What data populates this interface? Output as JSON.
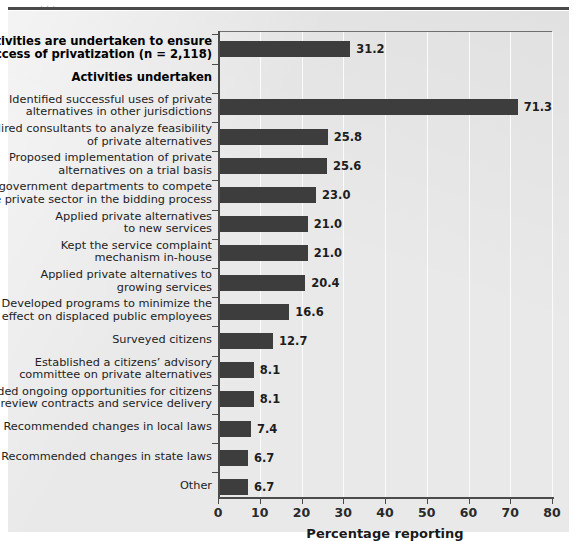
{
  "figure": {
    "caption_remnant": "                                    ,                    ,                 .",
    "background_color": "#e9e9e9",
    "bar_color": "#3d3d3d",
    "axis_color": "#4c4c4c",
    "gridline_color": "#fbfbfb"
  },
  "chart_data": {
    "type": "bar",
    "orientation": "horizontal",
    "title": "",
    "xlabel": "Percentage reporting",
    "ylabel": "",
    "xlim": [
      0,
      80
    ],
    "xticks": [
      0,
      10,
      20,
      30,
      40,
      50,
      60,
      70,
      80
    ],
    "grid": true,
    "legend": null,
    "categories": [
      "Activities are undertaken to ensure\nsuccess of privatization (n = 2,118)",
      "Activities undertaken",
      "Identified successful uses of private\nalternatives in other jurisdictions",
      "Hired consultants to analyze feasibility\nof private alternatives",
      "Proposed implementation of private\nalternatives on a trial basis",
      "Allowed government departments to compete\nwith the private sector in the bidding process",
      "Applied private alternatives\nto new services",
      "Kept the service complaint\nmechanism in-house",
      "Applied private alternatives to\ngrowing services",
      "Developed programs to minimize the\neffect on displaced public employees",
      "Surveyed citizens",
      "Established a citizens' advisory\ncommittee on private alternatives",
      "Provided ongoing opportunities for citizens\nto review contracts and service delivery",
      "Recommended changes in local laws",
      "Recommended changes in state laws",
      "Other"
    ],
    "values": [
      31.2,
      null,
      71.3,
      25.8,
      25.6,
      23.0,
      21.0,
      21.0,
      20.4,
      16.6,
      12.7,
      8.1,
      8.1,
      7.4,
      6.7,
      6.7
    ],
    "value_labels": [
      "31.2",
      "",
      "71.3",
      "25.8",
      "25.6",
      "23.0",
      "21.0",
      "21.0",
      "20.4",
      "16.6",
      "12.7",
      "8.1",
      "8.1",
      "7.4",
      "6.7",
      "6.7"
    ],
    "header_rows": [
      1
    ],
    "bold_rows": [
      0,
      1
    ]
  },
  "rows": [
    {
      "label": "Activities are undertaken to ensure\nsuccess of privatization (n = 2,118)",
      "value": 31.2,
      "value_label": "31.2",
      "bold": true,
      "is_header": false
    },
    {
      "label": "Activities undertaken",
      "value": null,
      "value_label": "",
      "bold": true,
      "is_header": true
    },
    {
      "label": "Identified successful uses of private\nalternatives in other jurisdictions",
      "value": 71.3,
      "value_label": "71.3",
      "bold": false,
      "is_header": false
    },
    {
      "label": "Hired consultants to analyze feasibility\nof private alternatives",
      "value": 25.8,
      "value_label": "25.8",
      "bold": false,
      "is_header": false
    },
    {
      "label": "Proposed implementation of private\nalternatives on a trial basis",
      "value": 25.6,
      "value_label": "25.6",
      "bold": false,
      "is_header": false
    },
    {
      "label": "Allowed government departments to compete\nwith the private sector in the bidding process",
      "value": 23.0,
      "value_label": "23.0",
      "bold": false,
      "is_header": false
    },
    {
      "label": "Applied private alternatives\nto new services",
      "value": 21.0,
      "value_label": "21.0",
      "bold": false,
      "is_header": false
    },
    {
      "label": "Kept the service complaint\nmechanism in-house",
      "value": 21.0,
      "value_label": "21.0",
      "bold": false,
      "is_header": false
    },
    {
      "label": "Applied private alternatives to\ngrowing services",
      "value": 20.4,
      "value_label": "20.4",
      "bold": false,
      "is_header": false
    },
    {
      "label": "Developed programs to minimize the\neffect on displaced public employees",
      "value": 16.6,
      "value_label": "16.6",
      "bold": false,
      "is_header": false
    },
    {
      "label": "Surveyed citizens",
      "value": 12.7,
      "value_label": "12.7",
      "bold": false,
      "is_header": false
    },
    {
      "label": "Established a citizens’ advisory\ncommittee on private alternatives",
      "value": 8.1,
      "value_label": "8.1",
      "bold": false,
      "is_header": false
    },
    {
      "label": "Provided ongoing opportunities for citizens\nto review contracts and service delivery",
      "value": 8.1,
      "value_label": "8.1",
      "bold": false,
      "is_header": false
    },
    {
      "label": "Recommended changes in local laws",
      "value": 7.4,
      "value_label": "7.4",
      "bold": false,
      "is_header": false
    },
    {
      "label": "Recommended changes in state laws",
      "value": 6.7,
      "value_label": "6.7",
      "bold": false,
      "is_header": false
    },
    {
      "label": "Other",
      "value": 6.7,
      "value_label": "6.7",
      "bold": false,
      "is_header": false
    }
  ],
  "axis": {
    "x_title": "Percentage reporting",
    "x_tick_labels": [
      "0",
      "10",
      "20",
      "30",
      "40",
      "50",
      "60",
      "70",
      "80"
    ]
  }
}
